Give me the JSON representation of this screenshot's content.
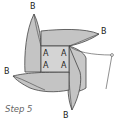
{
  "diagram": {
    "caption": "Step 5",
    "corner_labels": [
      "B",
      "B",
      "B",
      "B"
    ],
    "center_labels": [
      "A",
      "A",
      "A",
      "A"
    ],
    "colors": {
      "paper_fill": "#c8c8c8",
      "outline": "#444444",
      "center_fill": "#d4d4d4",
      "background": "#ffffff"
    }
  }
}
